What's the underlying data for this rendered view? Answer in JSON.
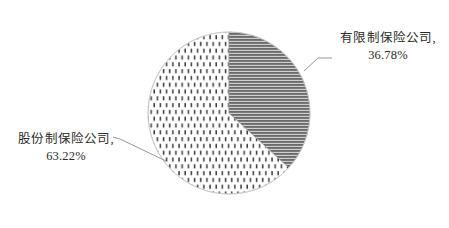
{
  "chart_data": {
    "type": "pie",
    "title": "",
    "subtitle": "",
    "xlabel": "",
    "ylabel": "",
    "grid": false,
    "legend_position": "none",
    "label_format": "{category}, {percent}%",
    "start_angle_deg": 0,
    "direction": "clockwise",
    "categories": [
      "有限制保险公司",
      "股份制保险公司"
    ],
    "values": [
      36.78,
      63.22
    ],
    "units": "%",
    "slices": [
      {
        "label": "有限制保险公司",
        "label_with_comma": "有限制保险公司,",
        "value": 36.78,
        "value_text": "36.78%",
        "fill_pattern": "horizontal-lines",
        "fill_color": "#6a6a6a",
        "background_color": "#d9d9d9",
        "start_angle_deg": 0,
        "end_angle_deg": 132.4
      },
      {
        "label": "股份制保险公司",
        "label_with_comma": "股份制保险公司,",
        "value": 63.22,
        "value_text": "63.22%",
        "fill_pattern": "vertical-dashes",
        "fill_color": "#3a3a3a",
        "background_color": "#ffffff",
        "start_angle_deg": 132.4,
        "end_angle_deg": 360
      }
    ]
  },
  "labels": {
    "limited": {
      "category": "有限制保险公司,",
      "percent": "36.78%"
    },
    "joint": {
      "category": "股份制保险公司,",
      "percent": "63.22%"
    }
  },
  "colors": {
    "background": "#ffffff",
    "text": "#2b2b2b",
    "leader_line": "#8c8c8c",
    "slice_dark_hatch": "#6a6a6a",
    "slice_light_dash": "#3a3a3a",
    "pie_outline": "#b5b5b5"
  }
}
